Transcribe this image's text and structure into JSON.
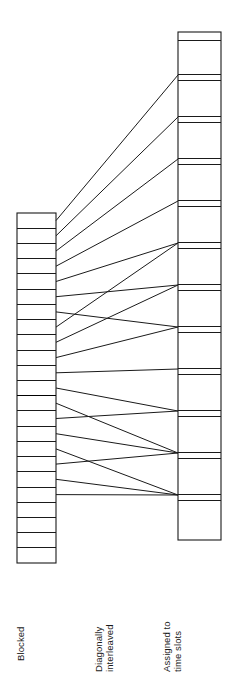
{
  "figure": {
    "labels": {
      "left_column": "Blocked",
      "middle": "Diagonally\ninterleaved",
      "right_column": "Assigned to\ntime slots"
    },
    "colors": {
      "stroke": "#1a1a1a",
      "background": "#ffffff",
      "emphasis": "#000000"
    }
  },
  "chart_data": {
    "type": "diagram",
    "xlabel": "",
    "ylabel": "",
    "grid": false,
    "legend": "none",
    "annotations": [
      "Blocked",
      "Diagonally interleaved",
      "Assigned to time slots"
    ],
    "left_column": {
      "name": "Blocked",
      "x": 17,
      "width": 39,
      "top": 213,
      "bottom": 563,
      "row_count": 23,
      "row_height": 15.2,
      "bold_row_boundary_index": 12,
      "row_boundaries": [
        213,
        228.2,
        243.4,
        258.6,
        273.9,
        289.1,
        304.3,
        319.5,
        334.7,
        350.0,
        365.2,
        380.4,
        395.6,
        410.9,
        426.1,
        441.3,
        456.5,
        471.7,
        487.0,
        502.2,
        517.4,
        532.6,
        547.8,
        563
      ]
    },
    "right_column": {
      "name": "Assigned to time slots",
      "x": 178,
      "width": 43,
      "top": 32,
      "bottom": 540,
      "slot_count": 12,
      "pair_gap": 6,
      "slot_tops": [
        32,
        74,
        116,
        158,
        200,
        242,
        284,
        326,
        368,
        410,
        452,
        494
      ],
      "slot_pitch": 42,
      "row_boundaries": [
        32,
        40,
        74,
        80,
        116,
        122,
        158,
        164,
        200,
        206,
        242,
        248,
        284,
        290,
        326,
        332,
        368,
        374,
        410,
        416,
        452,
        458,
        494,
        500,
        540
      ]
    },
    "connections": [
      {
        "from_row": 0,
        "to_slot": 0,
        "left_y": 220.6,
        "right_y": 75
      },
      {
        "from_row": 1,
        "to_slot": 1,
        "left_y": 235.8,
        "right_y": 117
      },
      {
        "from_row": 2,
        "to_slot": 2,
        "left_y": 251.0,
        "right_y": 159
      },
      {
        "from_row": 3,
        "to_slot": 3,
        "left_y": 266.2,
        "right_y": 201
      },
      {
        "from_row": 4,
        "to_slot": 4,
        "left_y": 281.5,
        "right_y": 243
      },
      {
        "from_row": 5,
        "to_slot": 5,
        "left_y": 296.7,
        "right_y": 285
      },
      {
        "from_row": 6,
        "to_slot": 6,
        "left_y": 311.9,
        "right_y": 327
      },
      {
        "from_row": 7,
        "to_slot": 4,
        "left_y": 327.1,
        "right_y": 243
      },
      {
        "from_row": 8,
        "to_slot": 5,
        "left_y": 342.3,
        "right_y": 285
      },
      {
        "from_row": 9,
        "to_slot": 6,
        "left_y": 357.6,
        "right_y": 327
      },
      {
        "from_row": 10,
        "to_slot": 7,
        "left_y": 372.8,
        "right_y": 369
      },
      {
        "from_row": 11,
        "to_slot": 8,
        "left_y": 388.0,
        "right_y": 411
      },
      {
        "from_row": 12,
        "to_slot": 9,
        "left_y": 403.2,
        "right_y": 453
      },
      {
        "from_row": 13,
        "to_slot": 8,
        "left_y": 418.5,
        "right_y": 411
      },
      {
        "from_row": 14,
        "to_slot": 9,
        "left_y": 433.7,
        "right_y": 453
      },
      {
        "from_row": 15,
        "to_slot": 10,
        "left_y": 448.9,
        "right_y": 495
      },
      {
        "from_row": 16,
        "to_slot": 9,
        "left_y": 464.1,
        "right_y": 453
      },
      {
        "from_row": 17,
        "to_slot": 10,
        "left_y": 479.3,
        "right_y": 495
      },
      {
        "from_row": 18,
        "to_slot": 10,
        "left_y": 494.6,
        "right_y": 495
      }
    ]
  }
}
